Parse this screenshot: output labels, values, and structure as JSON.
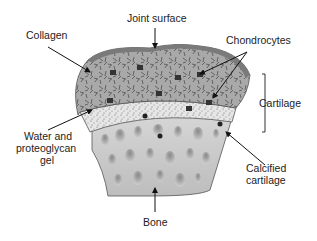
{
  "labels": {
    "joint_surface": "Joint surface",
    "collagen": "Collagen",
    "chondrocytes": "Chondrocytes",
    "cartilage": "Cartilage",
    "water_gel_line1": "Water and",
    "water_gel_line2": "proteoglycan",
    "water_gel_line3": "gel",
    "calcified_line1": "Calcified",
    "calcified_line2": "cartilage",
    "bone": "Bone"
  },
  "layers": [
    {
      "name": "joint-surface",
      "color": "#7a7a7a"
    },
    {
      "name": "cartilage-matrix",
      "color": "#a9a9a9"
    },
    {
      "name": "calcified-cartilage",
      "color": "#e2e2e2"
    },
    {
      "name": "bone",
      "color": "#c9c9c9"
    }
  ]
}
